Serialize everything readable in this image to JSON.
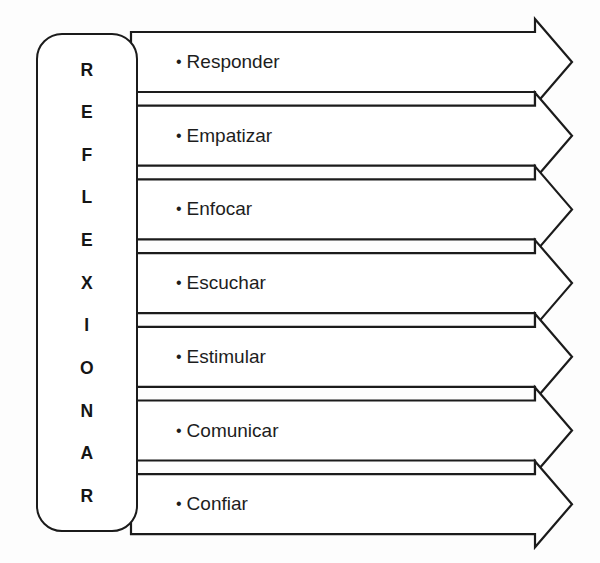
{
  "diagram": {
    "title": "REFLEXIONAR",
    "type": "acronym-arrow-list",
    "acronym": {
      "word": "REFLEXIONAR",
      "letters": [
        "R",
        "E",
        "F",
        "L",
        "E",
        "X",
        "I",
        "O",
        "N",
        "A",
        "R"
      ]
    },
    "bullet_glyph": "•",
    "colors": {
      "stroke": "#1b1b1b",
      "text": "#1d1d1d",
      "background": "#fdfdfd",
      "fill": "#ffffff"
    },
    "items": [
      {
        "label": "Responder",
        "index": 1
      },
      {
        "label": "Empatizar",
        "index": 2
      },
      {
        "label": "Enfocar",
        "index": 3
      },
      {
        "label": "Escuchar",
        "index": 4
      },
      {
        "label": "Estimular",
        "index": 5
      },
      {
        "label": "Comunicar",
        "index": 6
      },
      {
        "label": "Confiar",
        "index": 7
      }
    ]
  }
}
